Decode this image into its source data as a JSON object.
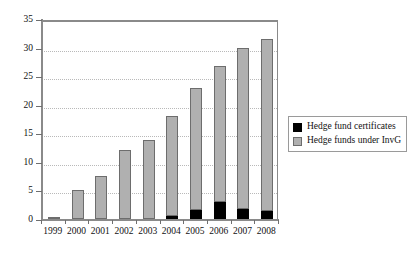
{
  "chart_data": {
    "type": "bar",
    "title": "",
    "subtitle": "",
    "xlabel": "",
    "ylabel": "",
    "stacked": true,
    "grid": true,
    "grid_axis": "y",
    "legend_position": "right",
    "ylim": [
      0,
      35
    ],
    "yticks": [
      0,
      5,
      10,
      15,
      20,
      25,
      30,
      35
    ],
    "ytick_labels": [
      "0",
      "5",
      "10",
      "15",
      "20",
      "25",
      "30",
      "35"
    ],
    "categories": [
      "1999",
      "2000",
      "2001",
      "2002",
      "2003",
      "2004",
      "2005",
      "2006",
      "2007",
      "2008"
    ],
    "series": [
      {
        "name": "Hedge fund certificates",
        "color": "#000000",
        "values": [
          0,
          0,
          0,
          0,
          0,
          0.6,
          1.6,
          3.0,
          1.7,
          1.4
        ]
      },
      {
        "name": "Hedge funds under InvG",
        "color": "#b0b0b0",
        "values": [
          0.2,
          5.0,
          7.6,
          12.0,
          13.9,
          17.4,
          21.4,
          23.8,
          28.3,
          30.1
        ]
      }
    ],
    "totals": [
      0.2,
      5.0,
      7.6,
      12.0,
      13.9,
      18.0,
      23.0,
      26.8,
      30.0,
      31.5
    ]
  },
  "legend": {
    "items": [
      {
        "label": "Hedge fund certificates",
        "swatch": "black-square-icon"
      },
      {
        "label": "Hedge funds under InvG",
        "swatch": "gray-square-icon"
      }
    ]
  }
}
